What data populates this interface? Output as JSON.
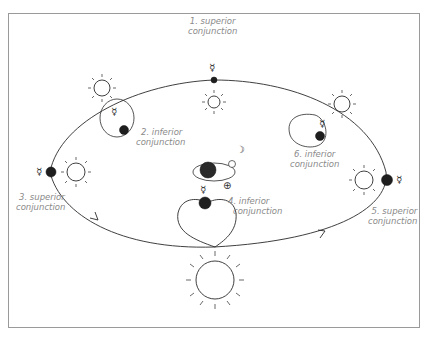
{
  "diagram": {
    "type": "geocentric-view-of-mercury-orbit",
    "colors": {
      "line": "#2a2a2a",
      "label": "#8a8a8a",
      "frame": "#9a9a9a",
      "planet": "#1e1e1e"
    },
    "symbols": {
      "mercury": "☿",
      "earth": "⊕",
      "moon": "☽"
    },
    "labels": [
      {
        "id": "1",
        "line1": "1. superior",
        "line2": "conjunction"
      },
      {
        "id": "2",
        "line1": "2. inferior",
        "line2": "conjunction"
      },
      {
        "id": "3",
        "line1": "3. superior",
        "line2": "conjunction"
      },
      {
        "id": "4",
        "line1": "4. inferior",
        "line2": "conjunction"
      },
      {
        "id": "5",
        "line1": "5. superior",
        "line2": "conjunction"
      },
      {
        "id": "6",
        "line1": "6. inferior",
        "line2": "conjunction"
      }
    ]
  }
}
